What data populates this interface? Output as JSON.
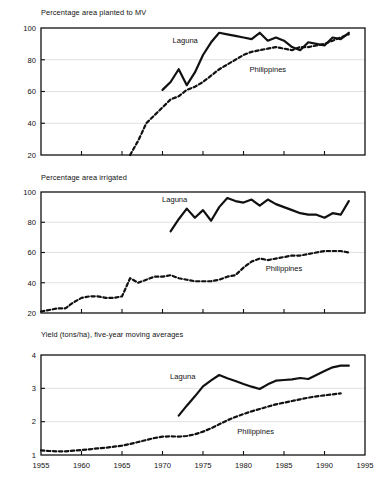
{
  "figure": {
    "width": 387,
    "height": 490,
    "background": "#ffffff",
    "ink_color": "#111111",
    "grid_color": "#d8d8d8"
  },
  "axis": {
    "x_ticks": [
      1955,
      1960,
      1965,
      1970,
      1975,
      1980,
      1985,
      1990,
      1995
    ],
    "x_tick_labels": [
      "1955",
      "1960",
      "1965",
      "1970",
      "1975",
      "1980",
      "1985",
      "1990",
      "1995"
    ],
    "xlim": [
      1955,
      1995
    ]
  },
  "series_labels": {
    "laguna": "Laguna",
    "philippines": "Philippines"
  },
  "chart_data": [
    {
      "type": "line",
      "title": "Percentage area planted to MV",
      "xlabel": "",
      "ylabel": "",
      "xlim": [
        1955,
        1995
      ],
      "ylim": [
        20,
        100
      ],
      "yticks": [
        20,
        40,
        60,
        80,
        100
      ],
      "ytick_labels": [
        "20",
        "40",
        "60",
        "80",
        "100"
      ],
      "grid": true,
      "legend": "inline-annotation",
      "annotations": [
        {
          "text": "Laguna",
          "x": 1972.8,
          "y": 90.5
        },
        {
          "text": "Philippines",
          "x": 1983.0,
          "y": 72.0
        }
      ],
      "series": [
        {
          "name": "Laguna",
          "style": "solid",
          "linewidth": 2.2,
          "x": [
            1970,
            1971,
            1972,
            1973,
            1974,
            1975,
            1976,
            1977,
            1978,
            1979,
            1980,
            1981,
            1982,
            1983,
            1984,
            1985,
            1986,
            1987,
            1988,
            1989,
            1990,
            1991,
            1992,
            1993
          ],
          "values": [
            61,
            66,
            74,
            64,
            72,
            83,
            91,
            97,
            96,
            95,
            94,
            93,
            97,
            92,
            94,
            92,
            88,
            86,
            91,
            90,
            89,
            94,
            93,
            97
          ]
        },
        {
          "name": "Philippines",
          "style": "dashed",
          "linewidth": 2.2,
          "x": [
            1966,
            1967,
            1968,
            1969,
            1970,
            1971,
            1972,
            1973,
            1974,
            1975,
            1976,
            1977,
            1978,
            1979,
            1980,
            1981,
            1982,
            1983,
            1984,
            1985,
            1986,
            1987,
            1988,
            1989,
            1990,
            1991,
            1992,
            1993
          ],
          "values": [
            20,
            29,
            40,
            45,
            50,
            55,
            57,
            61,
            63,
            66,
            70,
            74,
            77,
            80,
            83,
            85,
            86,
            87,
            88,
            87,
            86,
            88,
            88,
            89,
            90,
            92,
            94,
            96
          ]
        }
      ]
    },
    {
      "type": "line",
      "title": "Percentage area irrigated",
      "xlabel": "",
      "ylabel": "",
      "xlim": [
        1955,
        1995
      ],
      "ylim": [
        20,
        100
      ],
      "yticks": [
        20,
        40,
        60,
        80,
        100
      ],
      "ytick_labels": [
        "20",
        "40",
        "60",
        "80",
        "100"
      ],
      "grid": true,
      "legend": "inline-annotation",
      "annotations": [
        {
          "text": "Laguna",
          "x": 1971.5,
          "y": 93.5
        },
        {
          "text": "Philippines",
          "x": 1985.0,
          "y": 47.5
        }
      ],
      "series": [
        {
          "name": "Laguna",
          "style": "solid",
          "linewidth": 2.2,
          "x": [
            1971,
            1972,
            1973,
            1974,
            1975,
            1976,
            1977,
            1978,
            1979,
            1980,
            1981,
            1982,
            1983,
            1984,
            1985,
            1986,
            1987,
            1988,
            1989,
            1990,
            1991,
            1992,
            1993
          ],
          "values": [
            74,
            82,
            89,
            83,
            88,
            81,
            90,
            96,
            94,
            93,
            95,
            91,
            95,
            92,
            90,
            88,
            86,
            85,
            85,
            83,
            86,
            85,
            94
          ]
        },
        {
          "name": "Philippines",
          "style": "dashed",
          "linewidth": 2.2,
          "x": [
            1955,
            1956,
            1957,
            1958,
            1959,
            1960,
            1961,
            1962,
            1963,
            1964,
            1965,
            1966,
            1967,
            1968,
            1969,
            1970,
            1971,
            1972,
            1973,
            1974,
            1975,
            1976,
            1977,
            1978,
            1979,
            1980,
            1981,
            1982,
            1983,
            1984,
            1985,
            1986,
            1987,
            1988,
            1989,
            1990,
            1991,
            1992,
            1993
          ],
          "values": [
            21,
            22,
            23,
            23,
            27,
            30,
            31,
            31,
            30,
            30,
            31,
            43,
            40,
            42,
            44,
            44,
            45,
            43,
            42,
            41,
            41,
            41,
            42,
            44,
            45,
            50,
            54,
            56,
            55,
            56,
            57,
            58,
            58,
            59,
            60,
            61,
            61,
            61,
            60
          ]
        }
      ]
    },
    {
      "type": "line",
      "title": "Yield (tons/ha), five-year moving averages",
      "xlabel": "",
      "ylabel": "",
      "xlim": [
        1955,
        1995
      ],
      "ylim": [
        1,
        4
      ],
      "yticks": [
        1,
        2,
        3,
        4
      ],
      "ytick_labels": [
        "1",
        "2",
        "3",
        "4"
      ],
      "grid": true,
      "legend": "inline-annotation",
      "annotations": [
        {
          "text": "Laguna",
          "x": 1972.5,
          "y": 3.27
        },
        {
          "text": "Philippines",
          "x": 1981.5,
          "y": 1.62
        }
      ],
      "series": [
        {
          "name": "Laguna",
          "style": "solid",
          "linewidth": 2.2,
          "x": [
            1972,
            1973,
            1974,
            1975,
            1976,
            1977,
            1978,
            1979,
            1980,
            1981,
            1982,
            1983,
            1984,
            1985,
            1986,
            1987,
            1988,
            1989,
            1990,
            1991,
            1992,
            1993
          ],
          "values": [
            2.18,
            2.48,
            2.76,
            3.06,
            3.24,
            3.4,
            3.3,
            3.22,
            3.13,
            3.05,
            2.98,
            3.12,
            3.23,
            3.25,
            3.27,
            3.31,
            3.28,
            3.4,
            3.52,
            3.63,
            3.68,
            3.68
          ]
        },
        {
          "name": "Philippines",
          "style": "dashed",
          "linewidth": 2.2,
          "x": [
            1955,
            1956,
            1957,
            1958,
            1959,
            1960,
            1961,
            1962,
            1963,
            1964,
            1965,
            1966,
            1967,
            1968,
            1969,
            1970,
            1971,
            1972,
            1973,
            1974,
            1975,
            1976,
            1977,
            1978,
            1979,
            1980,
            1981,
            1982,
            1983,
            1984,
            1985,
            1986,
            1987,
            1988,
            1989,
            1990,
            1991,
            1992
          ],
          "values": [
            1.14,
            1.12,
            1.11,
            1.11,
            1.13,
            1.15,
            1.17,
            1.2,
            1.22,
            1.25,
            1.28,
            1.33,
            1.39,
            1.45,
            1.51,
            1.55,
            1.56,
            1.55,
            1.57,
            1.62,
            1.7,
            1.8,
            1.92,
            2.04,
            2.14,
            2.23,
            2.31,
            2.38,
            2.45,
            2.52,
            2.57,
            2.62,
            2.67,
            2.72,
            2.76,
            2.79,
            2.82,
            2.85
          ]
        }
      ]
    }
  ]
}
